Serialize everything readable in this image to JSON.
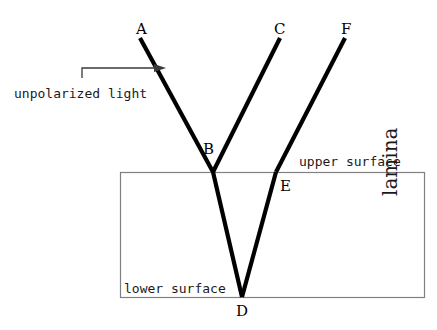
{
  "figure": {
    "background_color": "#ffffff",
    "ray_color": "#000000",
    "border_color": "#808080",
    "text_color": "#1a1a1a"
  },
  "points": {
    "A": "A",
    "B": "B",
    "C": "C",
    "D": "D",
    "E": "E",
    "F": "F"
  },
  "labels": {
    "unpolarized_light": "unpolarized light",
    "upper_surface": "upper surface",
    "lower_surface": "lower surface",
    "lamina": "lamina"
  },
  "geometry": {
    "lamina_rect": {
      "x": 120,
      "y": 172,
      "width": 304,
      "height": 125
    },
    "rays": [
      {
        "name": "incident-ray-AB",
        "from": [
          140,
          38
        ],
        "to": [
          213,
          172
        ]
      },
      {
        "name": "reflected-ray-BC",
        "from": [
          213,
          172
        ],
        "to": [
          280,
          38
        ]
      },
      {
        "name": "refracted-ray-BD",
        "from": [
          213,
          172
        ],
        "to": [
          242,
          297
        ]
      },
      {
        "name": "internal-ray-DE",
        "from": [
          242,
          297
        ],
        "to": [
          276,
          172
        ]
      },
      {
        "name": "emergent-ray-EF",
        "from": [
          276,
          172
        ],
        "to": [
          345,
          38
        ]
      }
    ],
    "arrow": {
      "from": [
        82,
        68
      ],
      "to": [
        164,
        68
      ],
      "tick_down": 10
    }
  }
}
